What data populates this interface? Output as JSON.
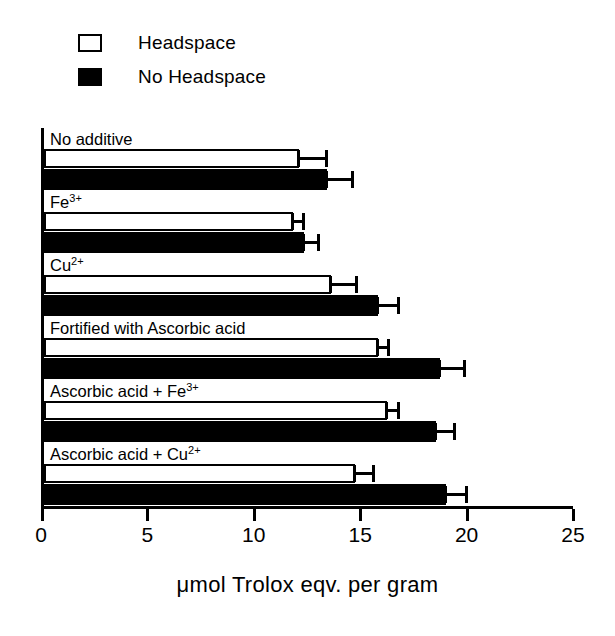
{
  "legend": {
    "position": "top-left",
    "items": [
      {
        "label": "Headspace",
        "style": "open",
        "swatch": "open-square-icon"
      },
      {
        "label": "No Headspace",
        "style": "filled",
        "swatch": "filled-square-icon"
      }
    ]
  },
  "axis": {
    "x_title": "μmol Trolox eqv. per gram",
    "x_ticks": [
      0,
      5,
      10,
      15,
      20,
      25
    ],
    "x_tick_labels": [
      "0",
      "5",
      "10",
      "15",
      "20",
      "25"
    ],
    "xmin": 0,
    "xmax": 25
  },
  "chart_data": {
    "type": "bar",
    "orientation": "horizontal",
    "title": "",
    "xlabel": "μmol Trolox eqv. per gram",
    "ylabel": "",
    "xlim": [
      0,
      25
    ],
    "grid": false,
    "legend_position": "top-left",
    "categories": [
      "No additive",
      "Fe3+",
      "Cu2+",
      "Fortified with Ascorbic acid",
      "Ascorbic acid + Fe3+",
      "Ascorbic acid + Cu2+"
    ],
    "category_labels_html": [
      "No additive",
      "Fe<sup>3+</sup>",
      "Cu<sup>2+</sup>",
      "Fortified with Ascorbic acid",
      "Ascorbic acid + Fe<sup>3+</sup>",
      "Ascorbic acid + Cu<sup>2+</sup>"
    ],
    "series": [
      {
        "name": "Headspace",
        "style": "open",
        "values": [
          12.0,
          11.7,
          13.5,
          15.7,
          16.1,
          14.6
        ],
        "errors": [
          1.3,
          0.5,
          1.2,
          0.5,
          0.6,
          0.9
        ]
      },
      {
        "name": "No Headspace",
        "style": "filled",
        "values": [
          13.3,
          12.2,
          15.7,
          18.6,
          18.4,
          18.9
        ],
        "errors": [
          1.2,
          0.7,
          1.0,
          1.2,
          0.9,
          1.0
        ]
      }
    ]
  },
  "colors": {
    "ink": "#000000",
    "paper": "#ffffff",
    "open_bar_fill": "#ffffff",
    "filled_bar_fill": "#000000"
  }
}
